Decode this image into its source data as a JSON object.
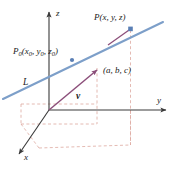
{
  "figure": {
    "background_color": "#ffffff",
    "width": 179,
    "height": 170
  },
  "axes": {
    "color": "#3a3a3a",
    "items": [
      {
        "name": "z-axis",
        "label": "z",
        "direction": "up"
      },
      {
        "name": "y-axis",
        "label": "y",
        "direction": "right"
      },
      {
        "name": "x-axis",
        "label": "x",
        "direction": "down-left"
      }
    ],
    "z_label": "z",
    "y_label": "y",
    "x_label": "x"
  },
  "line": {
    "name": "L",
    "label": "L",
    "color": "#6a8fc0"
  },
  "vector": {
    "name": "v",
    "label": "v",
    "color": "#8c4f7a",
    "component_label": "(a, b, c)"
  },
  "points": [
    {
      "name": "P0",
      "base": "P",
      "subscript": "0",
      "coords_open": "(",
      "coords": "x0, y0, z0",
      "coords_close": ")",
      "label": "P0(x0, y0, z0)",
      "marker_color": "#5a7fb5"
    },
    {
      "name": "P",
      "base": "P",
      "subscript": "",
      "coords_open": "(",
      "coords": "x, y, z",
      "coords_close": ")",
      "label": "P(x, y, z)",
      "marker_color": "#5a7fb5"
    }
  ],
  "projection_lines": {
    "name": "dashed-projection-lines",
    "color": "#dda8a0",
    "style": "dashed"
  },
  "labels": {
    "p_label_main": "P",
    "p_label_args": "(x, y, z)",
    "p0_label_main": "P",
    "p0_label_sub": "0",
    "p0_label_args_open": "(x",
    "p0_label_sub1": "0",
    "p0_label_mid1": ", y",
    "p0_label_sub2": "0",
    "p0_label_mid2": ", z",
    "p0_label_sub3": "0",
    "p0_label_close": ")",
    "abc_label": "(a, b, c)",
    "line_label": "L",
    "vector_label": "v",
    "z_axis_label": "z",
    "y_axis_label": "y",
    "x_axis_label": "x"
  }
}
